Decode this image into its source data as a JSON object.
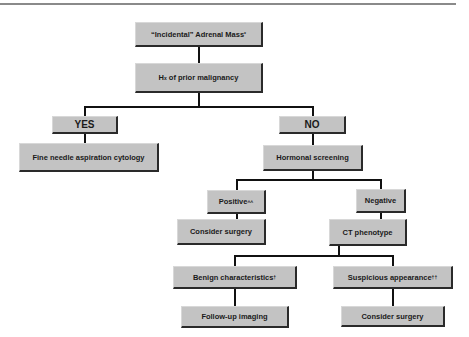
{
  "diagram": {
    "type": "flowchart",
    "colors": {
      "box_fill": "#c3c3c3",
      "box_shadow": "#2a2a2a",
      "connector": "#111111",
      "rule": "#8a8a8a"
    },
    "nodes": {
      "root": {
        "label": "“Incidental” Adrenal Mass",
        "mark": "*"
      },
      "history": {
        "label_prefix": "H",
        "label_sub": "x",
        "label_suffix": " of prior malignancy"
      },
      "yes": {
        "label": "YES"
      },
      "fna": {
        "label": "Fine needle aspiration cytology"
      },
      "no": {
        "label": "NO"
      },
      "hormonal": {
        "label": "Hormonal screening"
      },
      "positive": {
        "label": "Positive",
        "mark": "^^"
      },
      "surgery1": {
        "label": "Consider surgery"
      },
      "negative": {
        "label": "Negative"
      },
      "ct": {
        "label": "CT phenotype"
      },
      "benign": {
        "label": "Benign characteristics",
        "mark": "†"
      },
      "followup": {
        "label": "Follow-up imaging"
      },
      "suspicious": {
        "label": "Suspicious appearance",
        "mark": "††"
      },
      "surgery2": {
        "label": "Consider surgery"
      }
    },
    "edges": [
      [
        "root",
        "history"
      ],
      [
        "history",
        "yes"
      ],
      [
        "history",
        "no"
      ],
      [
        "yes",
        "fna"
      ],
      [
        "no",
        "hormonal"
      ],
      [
        "hormonal",
        "positive"
      ],
      [
        "hormonal",
        "negative"
      ],
      [
        "positive",
        "surgery1"
      ],
      [
        "negative",
        "ct"
      ],
      [
        "ct",
        "benign"
      ],
      [
        "ct",
        "suspicious"
      ],
      [
        "benign",
        "followup"
      ],
      [
        "suspicious",
        "surgery2"
      ]
    ]
  }
}
